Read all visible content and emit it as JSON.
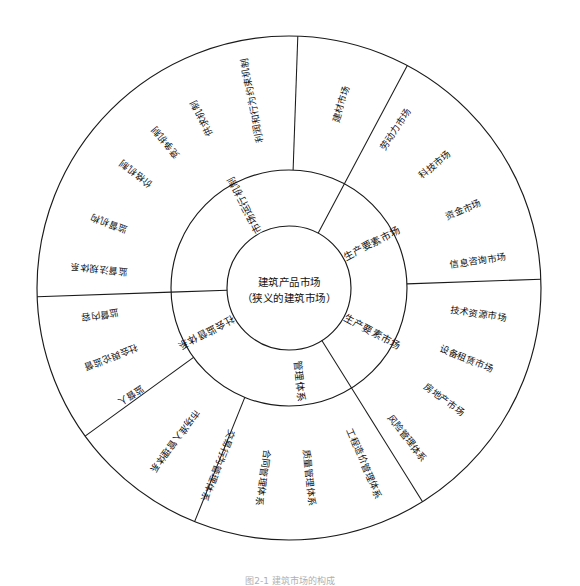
{
  "figure": {
    "type": "concentric-wheel-diagram",
    "caption": "图2-1 建筑市场的构成",
    "geometry": {
      "center_x": 289,
      "center_y": 288,
      "r_inner": 62,
      "r_middle": 118,
      "r_outer": 252,
      "sector_boundaries_deg": [
        -62,
        58,
        178
      ]
    },
    "colors": {
      "stroke": "#1a1a1a",
      "text": "#111111",
      "background": "#ffffff"
    }
  },
  "center": {
    "line1": "建筑产品市场",
    "line2": "（狭义的建筑市场）"
  },
  "middle_ring": {
    "sectors": [
      {
        "label": "市场运行机制",
        "angle_deg": -62,
        "mid_deg": -122
      },
      {
        "label": "生产要素市场",
        "angle_deg": 58,
        "mid_deg": -2
      },
      {
        "label": "建筑市场管理体系",
        "angle_deg": 178,
        "mid_deg": 58
      },
      {
        "label": "社会监督体系",
        "angle_deg": 178,
        "mid_deg": 118
      }
    ],
    "labels": [
      {
        "text": "市场运行机制",
        "mid_deg": -118
      },
      {
        "text": "生产要素市场",
        "mid_deg": -28
      },
      {
        "text": "生产要素市场",
        "mid_deg": 28
      },
      {
        "text": "管理体系",
        "mid_deg": 84
      },
      {
        "text": "社会监督体系",
        "mid_deg": 152
      }
    ]
  },
  "outer_ring": {
    "labels": [
      {
        "text": "利润和行为约束机制",
        "angle_deg": -101
      },
      {
        "text": "供求机制",
        "angle_deg": -117
      },
      {
        "text": "竞争机制",
        "angle_deg": -130
      },
      {
        "text": "价格机制",
        "angle_deg": -143
      },
      {
        "text": "监督机构",
        "angle_deg": -160
      },
      {
        "text": "监督法规体系",
        "angle_deg": -174
      },
      {
        "text": "监督内容",
        "angle_deg": 172
      },
      {
        "text": "社会舆论监督",
        "angle_deg": 159
      },
      {
        "text": "监督人",
        "angle_deg": 146
      },
      {
        "text": "市场准入管理体系",
        "angle_deg": 127
      },
      {
        "text": "交易行为管理体系",
        "angle_deg": 112
      },
      {
        "text": "合同管理体系",
        "angle_deg": 98
      },
      {
        "text": "质量管理体系",
        "angle_deg": 84
      },
      {
        "text": "工程造价管理体系",
        "angle_deg": 67
      },
      {
        "text": "风险管理体系",
        "angle_deg": 52
      },
      {
        "text": "房地产市场",
        "angle_deg": 36
      },
      {
        "text": "设备租赁市场",
        "angle_deg": 22
      },
      {
        "text": "技术资源市场",
        "angle_deg": 8
      },
      {
        "text": "信息咨询市场",
        "angle_deg": -8
      },
      {
        "text": "资金市场",
        "angle_deg": -24
      },
      {
        "text": "科技市场",
        "angle_deg": -40
      },
      {
        "text": "劳动力市场",
        "angle_deg": -56
      },
      {
        "text": "建材市场",
        "angle_deg": -74
      }
    ]
  }
}
